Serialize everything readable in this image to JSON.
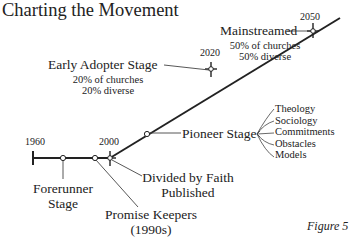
{
  "title": "Charting the Movement",
  "figure_label": "Figure 5",
  "timeline": {
    "years": {
      "start": "1960",
      "y2000": "2000",
      "y2020": "2020",
      "y2050": "2050"
    },
    "milestones": {
      "forerunner": {
        "line1": "Forerunner",
        "line2": "Stage"
      },
      "promise_keepers": {
        "line1": "Promise Keepers",
        "line2": "(1990s)"
      },
      "divided_by_faith": {
        "line1": "Divided by Faith",
        "line2": "Published"
      },
      "pioneer": {
        "label": "Pioneer Stage"
      },
      "early_adopter": {
        "label": "Early Adopter Stage",
        "line1": "20% of churches",
        "line2": "20% diverse"
      },
      "mainstreamed": {
        "label": "Mainstreamed",
        "line1": "50% of churches",
        "line2": "50% diverse"
      }
    },
    "pioneer_branches": [
      "Theology",
      "Sociology",
      "Commitments",
      "Obstacles",
      "Models"
    ]
  },
  "colors": {
    "line": "#222222",
    "text": "#222222",
    "background": "#ffffff"
  }
}
